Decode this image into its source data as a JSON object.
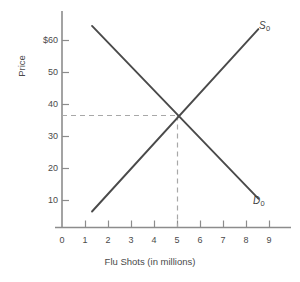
{
  "chart_data": {
    "type": "line",
    "title": "",
    "xlabel": "Flu Shots (in millions)",
    "ylabel": "Price",
    "xlim": [
      0,
      9.6
    ],
    "ylim": [
      0,
      66
    ],
    "grid": false,
    "legend_position": "inline-curve-labels",
    "x_ticks": [
      "0",
      "1",
      "2",
      "3",
      "4",
      "5",
      "6",
      "7",
      "8",
      "9"
    ],
    "x_tick_values": [
      0,
      1,
      2,
      3,
      4,
      5,
      6,
      7,
      8,
      9
    ],
    "y_ticks": [
      "10",
      "20",
      "30",
      "40",
      "50",
      "$60"
    ],
    "y_tick_values": [
      10,
      20,
      30,
      40,
      50,
      60
    ],
    "series": [
      {
        "name": "S0",
        "label": "S",
        "subscript": "0",
        "description": "Supply curve, upward sloping",
        "color": "#4a4a4a",
        "points": [
          [
            1.3,
            5
          ],
          [
            8.5,
            62
          ]
        ]
      },
      {
        "name": "D0",
        "label": "D",
        "subscript": "0",
        "description": "Demand curve, downward sloping",
        "color": "#4a4a4a",
        "points": [
          [
            1.3,
            63
          ],
          [
            8.5,
            9
          ]
        ]
      }
    ],
    "equilibrium": {
      "quantity": 5,
      "price": 35,
      "guide_color": "#a8a8a8"
    },
    "axis_color": "#8c8c8c"
  }
}
